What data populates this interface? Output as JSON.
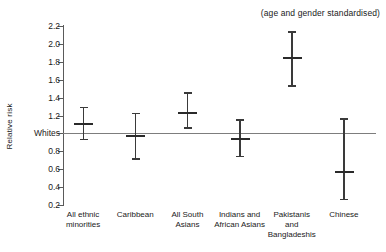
{
  "chart_data": {
    "type": "scatter",
    "title": "",
    "annotation": "(age and gender standardised)",
    "xlabel": "",
    "ylabel": "Relative risk",
    "ylim": [
      0.2,
      2.2
    ],
    "grid": false,
    "legend": "none",
    "reference_line": {
      "label": "Whites",
      "value": 1.0
    },
    "y_ticks": [
      {
        "value": 2.2,
        "label": "2.2"
      },
      {
        "value": 2.0,
        "label": "2.0"
      },
      {
        "value": 1.8,
        "label": "1.8"
      },
      {
        "value": 1.6,
        "label": "1.6"
      },
      {
        "value": 1.4,
        "label": "1.4"
      },
      {
        "value": 1.2,
        "label": "1.2"
      },
      {
        "value": 1.0,
        "label": "Whites"
      },
      {
        "value": 0.8,
        "label": "0.8"
      },
      {
        "value": 0.6,
        "label": "0.6"
      },
      {
        "value": 0.4,
        "label": "0.4"
      },
      {
        "value": 0.2,
        "label": "0.2"
      }
    ],
    "categories": [
      "All ethnic\nminorities",
      "Caribbean",
      "All South\nAsians",
      "Indians and\nAfrican Asians",
      "Pakistanis\nand\nBangladeshis",
      "Chinese"
    ],
    "values": [
      1.11,
      0.97,
      1.23,
      0.94,
      1.84,
      0.57
    ],
    "ci_low": [
      0.94,
      0.72,
      1.07,
      0.75,
      1.54,
      0.27
    ],
    "ci_high": [
      1.3,
      1.23,
      1.46,
      1.16,
      2.14,
      1.17
    ],
    "points": [
      {
        "category": "All ethnic minorities",
        "value": 1.11,
        "low": 0.94,
        "high": 1.3
      },
      {
        "category": "Caribbean",
        "value": 0.97,
        "low": 0.72,
        "high": 1.23
      },
      {
        "category": "All South Asians",
        "value": 1.23,
        "low": 1.07,
        "high": 1.46
      },
      {
        "category": "Indians and African Asians",
        "value": 0.94,
        "low": 0.75,
        "high": 1.16
      },
      {
        "category": "Pakistanis and Bangladeshis",
        "value": 1.84,
        "low": 1.54,
        "high": 2.14
      },
      {
        "category": "Chinese",
        "value": 0.57,
        "low": 0.27,
        "high": 1.17
      }
    ],
    "colors": {
      "marker": "#2a2a2a",
      "whisker": "#3a3a3a",
      "axis": "#5a5a5a",
      "reference_line": "#7d7d7d",
      "background": "#ffffff",
      "text": "#1a1a1a"
    }
  }
}
